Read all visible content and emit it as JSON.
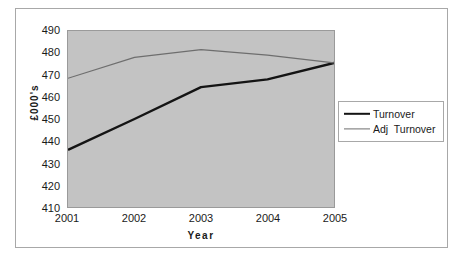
{
  "chart_data": {
    "type": "line",
    "title": "",
    "xlabel": "Year",
    "ylabel": "£000's",
    "categories": [
      "2001",
      "2002",
      "2003",
      "2004",
      "2005"
    ],
    "x": [
      2001,
      2002,
      2003,
      2004,
      2005
    ],
    "series": [
      {
        "name": "Turnover",
        "color": "#141414",
        "line_width": 2.4,
        "values": [
          436,
          450,
          464.5,
          468,
          475.5
        ]
      },
      {
        "name": "Adj  Turnover",
        "color": "#6e6e6e",
        "line_width": 1.2,
        "values": [
          468.5,
          478,
          481.5,
          479,
          475.5
        ]
      }
    ],
    "ylim": [
      410,
      490
    ],
    "y_ticks": [
      490,
      480,
      470,
      460,
      450,
      440,
      430,
      420,
      410
    ],
    "y_tick_labels": [
      "490",
      "480",
      "470",
      "460",
      "450",
      "440",
      "430",
      "420",
      "410"
    ],
    "x_tick_labels": [
      "2001",
      "2002",
      "2003",
      "2004",
      "2005"
    ],
    "grid": false,
    "legend_position": "right",
    "plot_background": "#c3c3c3",
    "figure_background": "#ffffff",
    "border_color": "#a8a8a8"
  },
  "legend": {
    "entries": [
      {
        "label": "Turnover"
      },
      {
        "label": "Adj  Turnover"
      }
    ]
  },
  "axes": {
    "y_title": "£000's",
    "x_title": "Year"
  }
}
